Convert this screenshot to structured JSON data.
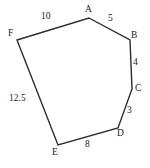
{
  "figure": {
    "type": "polygon-diagram",
    "stroke_color": "#2b2b2b",
    "fill_color": "none",
    "text_color": "#1a1a1a",
    "background_color": "#ffffff",
    "canvas": {
      "width": 150,
      "height": 168
    },
    "vertices": [
      {
        "name": "A",
        "label": "A",
        "x": 89,
        "y": 18,
        "label_x": 85,
        "label_y": 5
      },
      {
        "name": "B",
        "label": "B",
        "x": 130,
        "y": 40,
        "label_x": 131,
        "label_y": 31
      },
      {
        "name": "C",
        "label": "C",
        "x": 132,
        "y": 89,
        "label_x": 135,
        "label_y": 84
      },
      {
        "name": "D",
        "label": "D",
        "x": 118,
        "y": 128,
        "label_x": 117,
        "label_y": 129
      },
      {
        "name": "E",
        "label": "E",
        "x": 58,
        "y": 145,
        "label_x": 52,
        "label_y": 148
      },
      {
        "name": "F",
        "label": "F",
        "x": 17,
        "y": 40,
        "label_x": 8,
        "label_y": 29
      }
    ],
    "edges": [
      {
        "name": "FA",
        "from": "F",
        "to": "A",
        "length_label": "10",
        "label_x": 41,
        "label_y": 12
      },
      {
        "name": "AB",
        "from": "A",
        "to": "B",
        "length_label": "5",
        "label_x": 108,
        "label_y": 14
      },
      {
        "name": "BC",
        "from": "B",
        "to": "C",
        "length_label": "4",
        "label_x": 133,
        "label_y": 58
      },
      {
        "name": "CD",
        "from": "C",
        "to": "D",
        "length_label": "3",
        "label_x": 127,
        "label_y": 106
      },
      {
        "name": "DE",
        "from": "D",
        "to": "E",
        "length_label": "8",
        "label_x": 85,
        "label_y": 140
      },
      {
        "name": "EF",
        "from": "E",
        "to": "F",
        "length_label": "12.5",
        "label_x": 9,
        "label_y": 94
      }
    ],
    "polygon_points": "89,18 130,40 132,89 118,128 58,145 17,40"
  }
}
